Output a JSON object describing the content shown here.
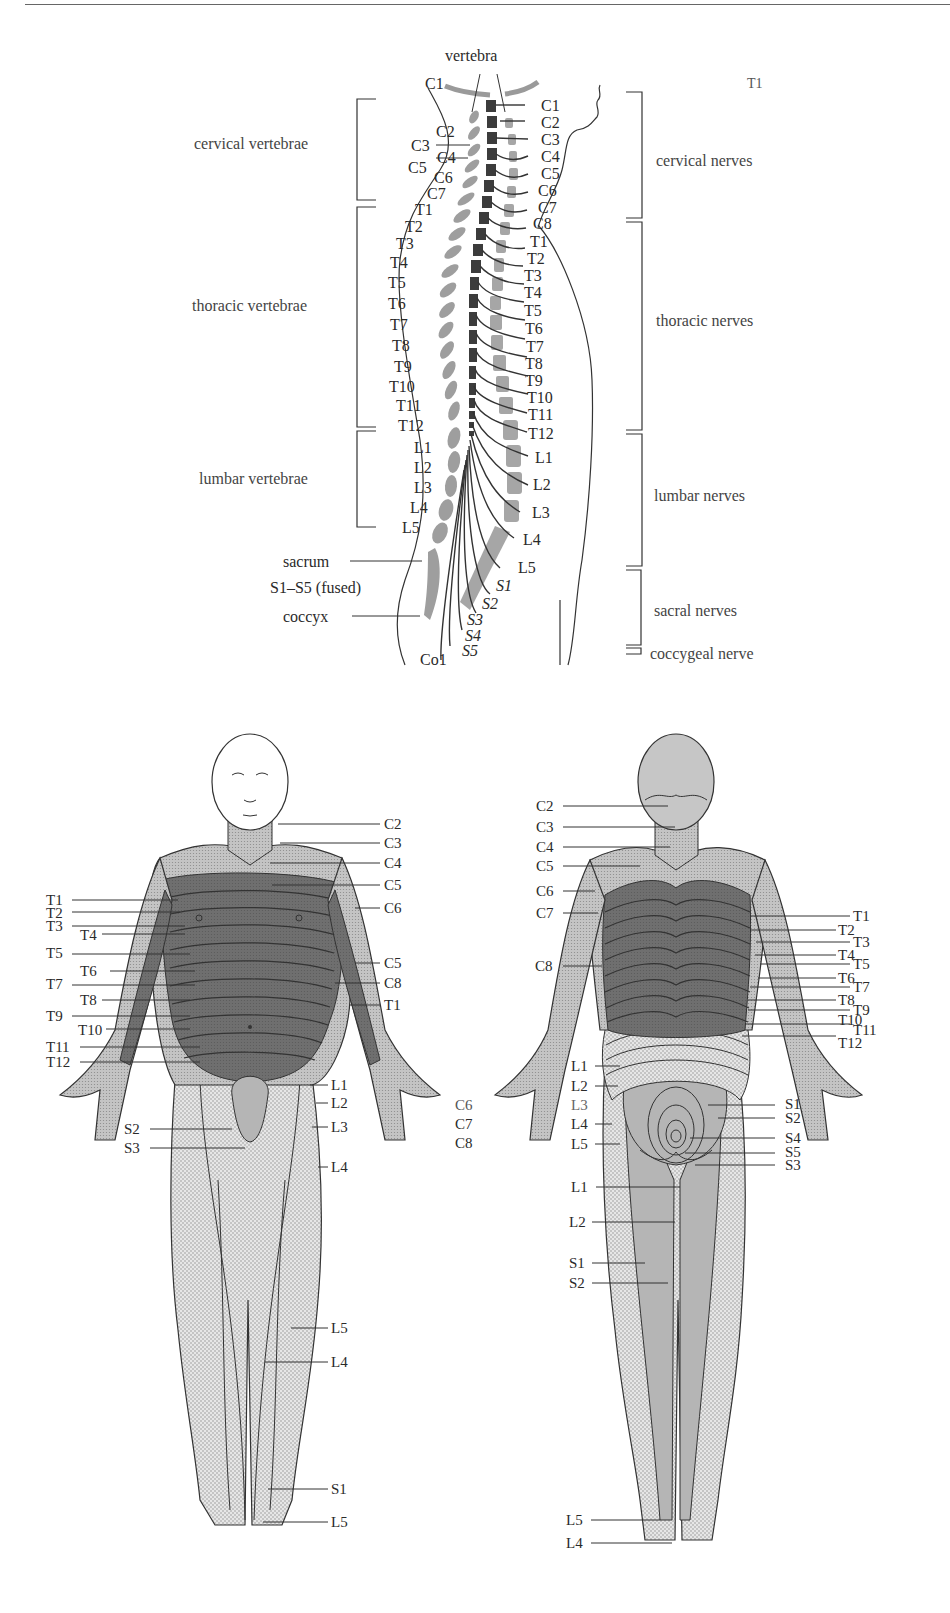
{
  "spine": {
    "top_label": "vertebra",
    "corner_label": "T1",
    "vertebra_groups": [
      {
        "label": "cervical vertebrae"
      },
      {
        "label": "thoracic vertebrae"
      },
      {
        "label": "lumbar vertebrae"
      }
    ],
    "nerve_groups": [
      {
        "label": "cervical nerves"
      },
      {
        "label": "thoracic nerves"
      },
      {
        "label": "lumbar nerves"
      },
      {
        "label": "sacral nerves"
      },
      {
        "label": "coccygeal nerve"
      }
    ],
    "left_labels": [
      "C1",
      "C2",
      "C3",
      "C4",
      "C5",
      "C6",
      "C7",
      "T1",
      "T2",
      "T3",
      "T4",
      "T5",
      "T6",
      "T7",
      "T8",
      "T9",
      "T10",
      "T11",
      "T12",
      "L1",
      "L2",
      "L3",
      "L4",
      "L5"
    ],
    "right_labels": [
      "C1",
      "C2",
      "C3",
      "C4",
      "C5",
      "C6",
      "C7",
      "C8",
      "T1",
      "T2",
      "T3",
      "T4",
      "T5",
      "T6",
      "T7",
      "T8",
      "T9",
      "T10",
      "T11",
      "T12",
      "L1",
      "L2",
      "L3",
      "L4",
      "L5",
      "S1",
      "S2",
      "S3",
      "S4",
      "S5"
    ],
    "bottom_labels": {
      "sacrum": "sacrum",
      "fused": "S1–S5 (fused)",
      "coccyx": "coccyx",
      "co1": "Co1"
    }
  },
  "front_body": {
    "left_labels": [
      "T1",
      "T2",
      "T3",
      "T4",
      "T5",
      "T6",
      "T7",
      "T8",
      "T9",
      "T10",
      "T11",
      "T12",
      "S2",
      "S3"
    ],
    "right_labels": [
      "C2",
      "C3",
      "C4",
      "C5",
      "C6",
      "C5",
      "C8",
      "T1",
      "L1",
      "L2",
      "L3",
      "L4",
      "L5",
      "L4",
      "S1",
      "L5"
    ],
    "hand_labels": [
      "C6",
      "C7",
      "C8"
    ]
  },
  "back_body": {
    "left_labels": [
      "C2",
      "C3",
      "C4",
      "C5",
      "C6",
      "C7",
      "C8",
      "L1",
      "L2",
      "L3",
      "L4",
      "L5",
      "L1",
      "L2",
      "S1",
      "S2",
      "L5",
      "L4"
    ],
    "right_labels": [
      "T1",
      "T2",
      "T3",
      "T4",
      "T5",
      "T6",
      "T7",
      "T8",
      "T9",
      "T10",
      "T11",
      "T12",
      "S1",
      "S2",
      "S4",
      "S5",
      "S3"
    ]
  },
  "colors": {
    "dark_band": "#6e6e6e",
    "mid_band": "#b5b5b5",
    "light_band": "#d6d6d6",
    "vertebra_gray": "#9a9a9a",
    "cord_dark": "#3c3c3c",
    "line": "#333333"
  }
}
